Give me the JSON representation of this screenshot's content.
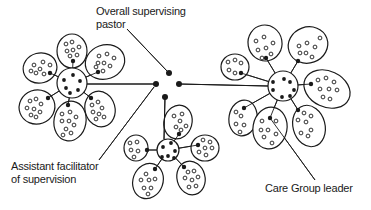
{
  "diagram": {
    "type": "organizational-network",
    "labels": {
      "pastor_line1": "Overall supervising",
      "pastor_line2": "pastor",
      "assistant_line1": "Assistant facilitator",
      "assistant_line2": "of supervision",
      "leader": "Care Group leader"
    },
    "colors": {
      "ink": "#1a1a1a",
      "background": "#ffffff"
    },
    "central_dots": [
      [
        169,
        73
      ],
      [
        156,
        84
      ],
      [
        179,
        84
      ],
      [
        165,
        97
      ]
    ],
    "clusters": [
      {
        "name": "left",
        "hub": {
          "cx": 72,
          "cy": 83,
          "r": 15,
          "dots": [
            [
              73,
              75
            ],
            [
              64,
              80
            ],
            [
              80,
              81
            ],
            [
              66,
              88
            ],
            [
              78,
              90
            ],
            [
              70,
              93
            ]
          ]
        },
        "petals": [
          {
            "cx": 72,
            "cy": 51,
            "rx": 15,
            "ry": 17,
            "rot": 0,
            "leader": [
              73,
              61
            ],
            "members": [
              [
                66,
                44
              ],
              [
                72,
                42
              ],
              [
                67,
                51
              ],
              [
                73,
                50
              ],
              [
                79,
                47
              ],
              [
                77,
                55
              ],
              [
                70,
                56
              ]
            ]
          },
          {
            "cx": 40,
            "cy": 68,
            "rx": 17,
            "ry": 15,
            "rot": -15,
            "leader": [
              50,
              73
            ],
            "members": [
              [
                34,
                65
              ],
              [
                43,
                62
              ],
              [
                40,
                69
              ],
              [
                36,
                73
              ],
              [
                44,
                74
              ],
              [
                31,
                71
              ],
              [
                50,
                65
              ]
            ]
          },
          {
            "cx": 105,
            "cy": 62,
            "rx": 20,
            "ry": 17,
            "rot": -20,
            "leader": [
              98,
              72
            ],
            "members": [
              [
                99,
                56
              ],
              [
                107,
                54
              ],
              [
                114,
                58
              ],
              [
                98,
                63
              ],
              [
                104,
                63
              ],
              [
                110,
                66
              ],
              [
                103,
                71
              ],
              [
                96,
                67
              ]
            ]
          },
          {
            "cx": 37,
            "cy": 107,
            "rx": 18,
            "ry": 17,
            "rot": -20,
            "leader": [
              48,
              98
            ],
            "members": [
              [
                30,
                101
              ],
              [
                36,
                99
              ],
              [
                41,
                104
              ],
              [
                27,
                108
              ],
              [
                34,
                109
              ],
              [
                40,
                112
              ],
              [
                31,
                115
              ],
              [
                36,
                117
              ]
            ]
          },
          {
            "cx": 70,
            "cy": 121,
            "rx": 16,
            "ry": 20,
            "rot": 10,
            "leader": [
              68,
              105
            ],
            "members": [
              [
                62,
                114
              ],
              [
                70,
                112
              ],
              [
                76,
                117
              ],
              [
                62,
                121
              ],
              [
                69,
                121
              ],
              [
                74,
                125
              ],
              [
                66,
                129
              ],
              [
                71,
                133
              ],
              [
                63,
                135
              ]
            ]
          },
          {
            "cx": 100,
            "cy": 109,
            "rx": 15,
            "ry": 18,
            "rot": -15,
            "leader": [
              91,
              98
            ],
            "members": [
              [
                92,
                105
              ],
              [
                98,
                102
              ],
              [
                102,
                108
              ],
              [
                93,
                112
              ],
              [
                99,
                114
              ],
              [
                104,
                117
              ],
              [
                96,
                119
              ]
            ]
          }
        ]
      },
      {
        "name": "right",
        "hub": {
          "cx": 283,
          "cy": 86,
          "r": 15,
          "dots": [
            [
              273,
              82
            ],
            [
              273,
              90
            ],
            [
              284,
              79
            ],
            [
              290,
              82
            ],
            [
              294,
              90
            ],
            [
              282,
              97
            ],
            [
              290,
              96
            ]
          ]
        },
        "petals": [
          {
            "cx": 265,
            "cy": 43,
            "rx": 17,
            "ry": 18,
            "rot": -10,
            "leader": [
              266,
              58
            ],
            "members": [
              [
                256,
                41
              ],
              [
                264,
                37
              ],
              [
                273,
                43
              ],
              [
                258,
                50
              ],
              [
                266,
                48
              ],
              [
                271,
                54
              ],
              [
                262,
                58
              ]
            ]
          },
          {
            "cx": 308,
            "cy": 45,
            "rx": 20,
            "ry": 18,
            "rot": -20,
            "leader": [
              298,
              61
            ],
            "members": [
              [
                299,
                46
              ],
              [
                307,
                43
              ],
              [
                315,
                47
              ],
              [
                306,
                53
              ],
              [
                312,
                57
              ],
              [
                300,
                53
              ],
              [
                320,
                38
              ]
            ]
          },
          {
            "cx": 235,
            "cy": 67,
            "rx": 14,
            "ry": 13,
            "rot": 0,
            "leader": [
              241,
              73
            ],
            "members": [
              [
                228,
                62
              ],
              [
                235,
                60
              ],
              [
                241,
                63
              ],
              [
                229,
                70
              ],
              [
                235,
                73
              ]
            ]
          },
          {
            "cx": 327,
            "cy": 89,
            "rx": 24,
            "ry": 18,
            "rot": 25,
            "leader": [
              311,
              84
            ],
            "members": [
              [
                318,
                80
              ],
              [
                326,
                78
              ],
              [
                334,
                82
              ],
              [
                320,
                89
              ],
              [
                329,
                89
              ],
              [
                337,
                90
              ],
              [
                323,
                97
              ],
              [
                330,
                99
              ]
            ]
          },
          {
            "cx": 243,
            "cy": 118,
            "rx": 14,
            "ry": 18,
            "rot": 10,
            "leader": [
              244,
              108
            ],
            "members": [
              [
                236,
                112
              ],
              [
                241,
                116
              ],
              [
                236,
                124
              ],
              [
                244,
                125
              ],
              [
                240,
                132
              ]
            ]
          },
          {
            "cx": 270,
            "cy": 128,
            "rx": 17,
            "ry": 21,
            "rot": 10,
            "leader": [
              270,
              118
            ],
            "members": [
              [
                262,
                121
              ],
              [
                276,
                121
              ],
              [
                261,
                130
              ],
              [
                268,
                130
              ],
              [
                276,
                134
              ],
              [
                264,
                137
              ],
              [
                272,
                143
              ]
            ]
          },
          {
            "cx": 309,
            "cy": 126,
            "rx": 16,
            "ry": 21,
            "rot": -15,
            "leader": [
              298,
              110
            ],
            "members": [
              [
                304,
                113
              ],
              [
                311,
                116
              ],
              [
                298,
                120
              ],
              [
                306,
                122
              ],
              [
                311,
                130
              ],
              [
                301,
                133
              ],
              [
                308,
                136
              ]
            ]
          }
        ]
      },
      {
        "name": "bottom",
        "hub": {
          "cx": 168,
          "cy": 150,
          "r": 11,
          "dots": [
            [
              163,
              147
            ],
            [
              171,
              143
            ],
            [
              175,
              151
            ],
            [
              168,
              156
            ],
            [
              162,
              157
            ],
            [
              174,
              158
            ]
          ]
        },
        "petals": [
          {
            "cx": 136,
            "cy": 148,
            "rx": 12,
            "ry": 13,
            "rot": 0,
            "leader": [
              147,
              150
            ],
            "members": [
              [
                130,
                143
              ],
              [
                137,
                142
              ],
              [
                131,
                150
              ],
              [
                138,
                151
              ],
              [
                134,
                157
              ]
            ]
          },
          {
            "cx": 178,
            "cy": 122,
            "rx": 14,
            "ry": 17,
            "rot": 15,
            "leader": [
              179,
              134
            ],
            "members": [
              [
                174,
                116
              ],
              [
                182,
                114
              ],
              [
                180,
                121
              ],
              [
                186,
                126
              ],
              [
                176,
                127
              ],
              [
                181,
                130
              ]
            ]
          },
          {
            "cx": 205,
            "cy": 148,
            "rx": 14,
            "ry": 13,
            "rot": 0,
            "leader": [
              198,
              145
            ],
            "members": [
              [
                203,
                140
              ],
              [
                210,
                142
              ],
              [
                205,
                148
              ],
              [
                212,
                148
              ],
              [
                206,
                155
              ],
              [
                199,
                152
              ]
            ]
          },
          {
            "cx": 148,
            "cy": 181,
            "rx": 15,
            "ry": 18,
            "rot": 20,
            "leader": [
              155,
              169
            ],
            "members": [
              [
                146,
                174
              ],
              [
                141,
                180
              ],
              [
                149,
                180
              ],
              [
                155,
                179
              ],
              [
                144,
                188
              ],
              [
                151,
                188
              ],
              [
                148,
                194
              ]
            ]
          },
          {
            "cx": 191,
            "cy": 178,
            "rx": 14,
            "ry": 17,
            "rot": -15,
            "leader": [
              184,
              167
            ],
            "members": [
              [
                188,
                172
              ],
              [
                194,
                171
              ],
              [
                185,
                178
              ],
              [
                192,
                180
              ],
              [
                198,
                177
              ],
              [
                189,
                187
              ],
              [
                196,
                186
              ]
            ]
          }
        ]
      }
    ],
    "connections": [
      {
        "from": [
          156,
          84
        ],
        "to": [
          87,
          84
        ],
        "desc": "pastor-to-left-hub"
      },
      {
        "from": [
          179,
          84
        ],
        "to": [
          268,
          86
        ],
        "desc": "pastor-to-right-hub"
      },
      {
        "from": [
          165,
          97
        ],
        "to": [
          164,
          139
        ],
        "desc": "pastor-to-bottom-hub"
      }
    ],
    "pointers": [
      {
        "from": [
          127,
          29
        ],
        "to": [
          167,
          71
        ],
        "desc": "pastor-label-pointer"
      },
      {
        "from": [
          99,
          160
        ],
        "to": [
          154,
          87
        ],
        "desc": "assistant-label-pointer"
      },
      {
        "from": [
          315,
          180
        ],
        "to": [
          270,
          118
        ],
        "desc": "leader-label-pointer"
      }
    ]
  }
}
